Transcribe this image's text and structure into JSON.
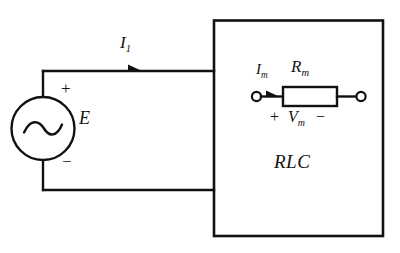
{
  "figure": {
    "background_color": "#ffffff",
    "line_color": "#111111"
  },
  "source": {
    "symbol": "ac-source",
    "waveform_glyph": "sine",
    "label": "E",
    "polarity_plus": "+",
    "polarity_minus": "−"
  },
  "wires": {
    "top_current_label": "I",
    "top_current_subscript": "1",
    "top_current_arrow": "right-arrow"
  },
  "network_box": {
    "label": "RLC"
  },
  "measurement_branch": {
    "current_label": "I",
    "current_subscript": "m",
    "current_arrow": "right-arrow",
    "resistor_label": "R",
    "resistor_subscript": "m",
    "voltage_plus": "+",
    "voltage_label": "V",
    "voltage_subscript": "m",
    "voltage_minus": "−",
    "left_terminal": "open-terminal",
    "right_terminal": "open-terminal"
  }
}
